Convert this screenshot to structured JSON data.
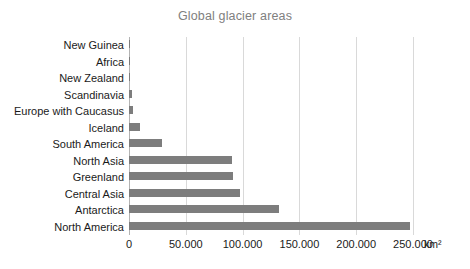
{
  "chart_data": {
    "type": "bar",
    "orientation": "horizontal",
    "title": "Global glacier areas",
    "xlabel": "",
    "ylabel": "",
    "unit_label": "km²",
    "xlim": [
      0,
      250000
    ],
    "grid": true,
    "grid_axis": "x",
    "legend": false,
    "bar_color": "#7d7d7d",
    "grid_color": "#d9d9d9",
    "axis_color": "#b3b3b3",
    "title_color": "#808080",
    "label_color": "#1a1a1a",
    "tick_labels": [
      "0",
      "50.000",
      "100.000",
      "150.000",
      "200.000",
      "250.000"
    ],
    "tick_values": [
      0,
      50000,
      100000,
      150000,
      200000,
      250000
    ],
    "categories": [
      "New Guinea",
      "Africa",
      "New Zealand",
      "Scandinavia",
      "Europe with Caucasus",
      "Iceland",
      "South America",
      "North Asia",
      "Greenland",
      "Central Asia",
      "Antarctica",
      "North America"
    ],
    "values": [
      300,
      500,
      1200,
      3000,
      3500,
      10000,
      29000,
      91000,
      91500,
      98000,
      132000,
      247000
    ]
  }
}
